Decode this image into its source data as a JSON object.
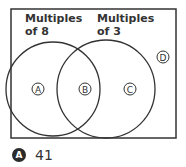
{
  "diagram": {
    "type": "venn",
    "sets": [
      {
        "label_line1": "Multiples",
        "label_line2": "of 8"
      },
      {
        "label_line1": "Multiples",
        "label_line2": "of 3"
      }
    ],
    "regions": [
      {
        "letter": "A",
        "description": "multiples of 8 only"
      },
      {
        "letter": "B",
        "description": "multiples of 8 and 3"
      },
      {
        "letter": "C",
        "description": "multiples of 3 only"
      },
      {
        "letter": "D",
        "description": "neither"
      }
    ]
  },
  "answer": {
    "choice": "A",
    "value": "41"
  }
}
